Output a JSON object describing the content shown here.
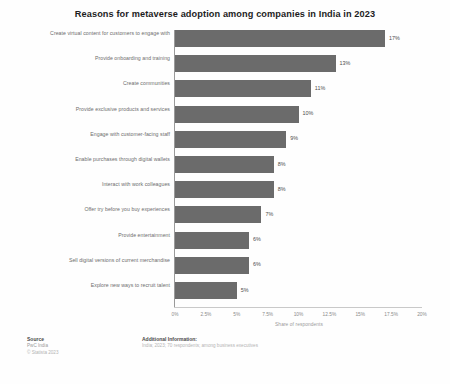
{
  "chart_data": {
    "type": "bar",
    "orientation": "horizontal",
    "title": "Reasons for metaverse adoption among companies in India in 2023",
    "xlabel": "Share of respondents",
    "ylabel": "",
    "xlim": [
      0,
      20
    ],
    "grid": false,
    "legend": null,
    "xticks": [
      "0%",
      "2.5%",
      "5%",
      "7.5%",
      "10%",
      "12.5%",
      "15%",
      "17.5%",
      "20%"
    ],
    "xtick_values": [
      0,
      2.5,
      5,
      7.5,
      10,
      12.5,
      15,
      17.5,
      20
    ],
    "categories": [
      "Create virtual content for customers to engage with",
      "Provide onboarding and training",
      "Create communities",
      "Provide exclusive products and services",
      "Engage with customer-facing staff",
      "Enable purchases through digital wallets",
      "Interact with work colleagues",
      "Offer try before you buy experiences",
      "Provide entertainment",
      "Sell digital versions of current merchandise",
      "Explore new ways to recruit talent"
    ],
    "values": [
      17,
      13,
      11,
      10,
      9,
      8,
      8,
      7,
      6,
      6,
      5
    ],
    "data_labels": [
      "17%",
      "13%",
      "11%",
      "10%",
      "9%",
      "8%",
      "8%",
      "7%",
      "6%",
      "6%",
      "5%"
    ],
    "bar_color": "#6b6b6b"
  },
  "footer": {
    "source_heading": "Source",
    "source_lines": [
      "PwC India",
      "© Statista 2023"
    ],
    "additional_heading": "Additional Information:",
    "additional_lines": [
      "India; 2023; 70 respondents; among business executives"
    ]
  }
}
